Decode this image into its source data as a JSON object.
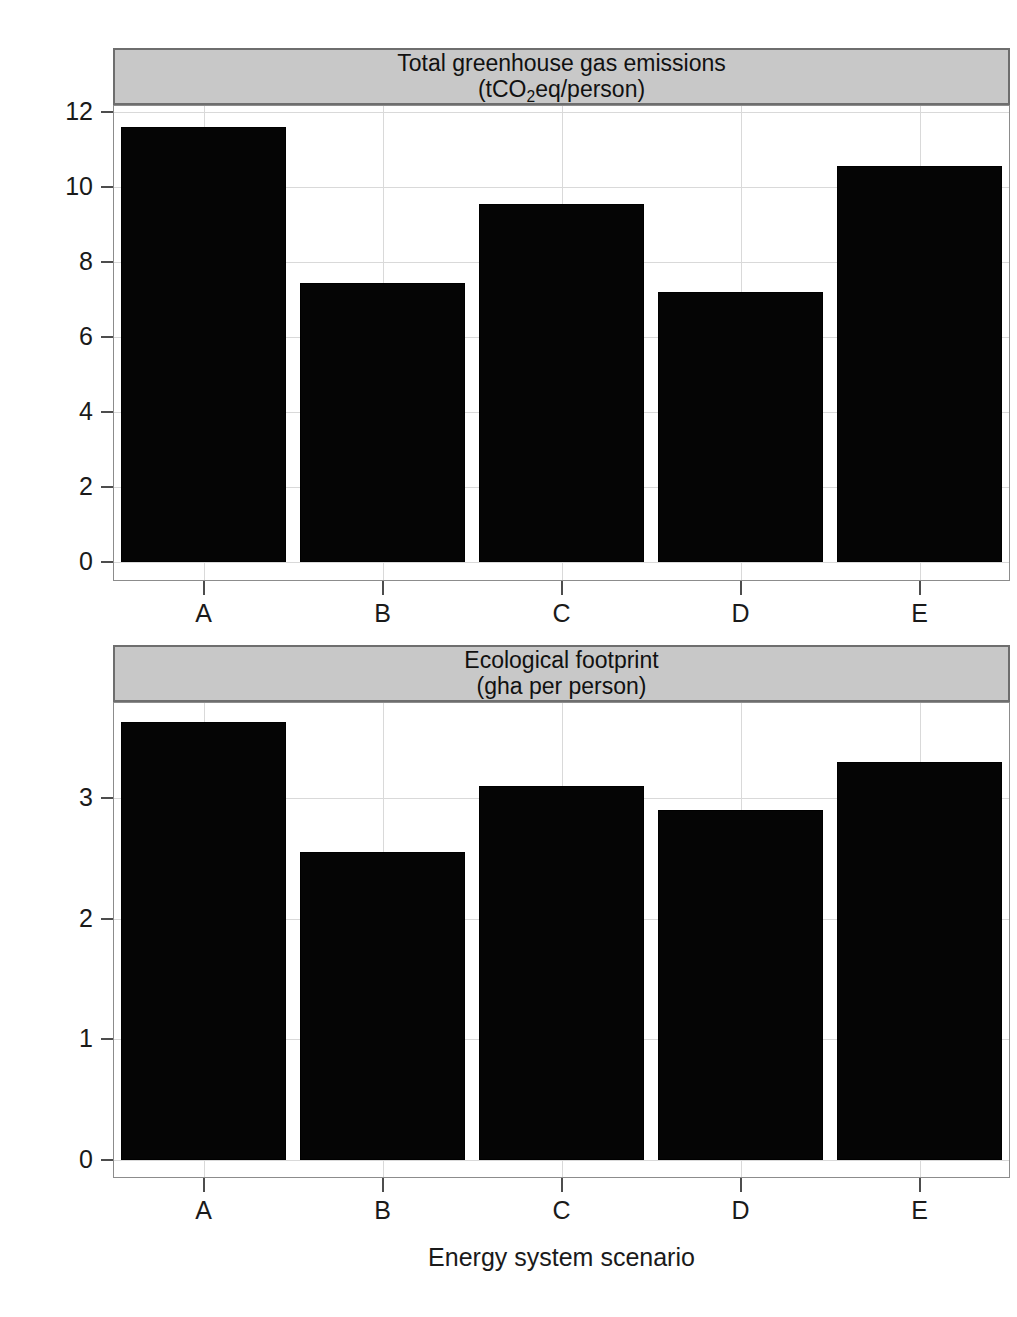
{
  "figure": {
    "y_axis_group_label": "Value",
    "x_axis_group_label": "Energy system scenario",
    "bar_color": "#050505",
    "strip_color": "#c8c8c8",
    "grid_color": "#d9d9d9"
  },
  "chart_data": [
    {
      "type": "bar",
      "panel_index": 0,
      "title": "Total greenhouse gas emissions",
      "subtitle": "(tCO2eq/person)",
      "title_line1": "Total greenhouse gas emissions",
      "title_line2_prefix": "(tCO",
      "title_line2_sub": "2",
      "title_line2_suffix": "eq/person)",
      "categories": [
        "A",
        "B",
        "C",
        "D",
        "E"
      ],
      "values": [
        11.6,
        7.45,
        9.55,
        7.2,
        10.55
      ],
      "xlabel": "Energy system scenario",
      "ylabel": "Value",
      "yticks": [
        0,
        2,
        4,
        6,
        8,
        10,
        12
      ],
      "ytick_labels": [
        "0",
        "2",
        "4",
        "6",
        "8",
        "10",
        "12"
      ],
      "ylim": [
        -0.47,
        12.15
      ],
      "grid": true,
      "legend": "none"
    },
    {
      "type": "bar",
      "panel_index": 1,
      "title": "Ecological footprint",
      "subtitle": "(gha per person)",
      "title_line1": "Ecological footprint",
      "title_line2": "(gha per person)",
      "categories": [
        "A",
        "B",
        "C",
        "D",
        "E"
      ],
      "values": [
        3.63,
        2.55,
        3.1,
        2.9,
        3.3
      ],
      "xlabel": "Energy system scenario",
      "ylabel": "Value",
      "yticks": [
        0,
        1,
        2,
        3
      ],
      "ytick_labels": [
        "0",
        "1",
        "2",
        "3"
      ],
      "ylim": [
        -0.145,
        3.79
      ],
      "grid": true,
      "legend": "none"
    }
  ]
}
